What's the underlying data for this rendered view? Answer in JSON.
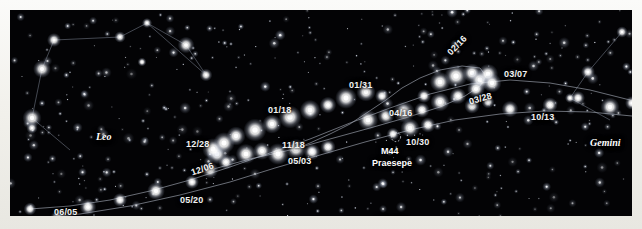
{
  "figure": {
    "kind": "star-chart",
    "sky_color": "#030305",
    "paper_color": "#f4f3ef",
    "label_color": "#f2f2f2",
    "track_color": "#9aa0ac"
  },
  "constellations": [
    {
      "name": "Leo",
      "x": 86,
      "y": 122,
      "rot": 0
    },
    {
      "name": "Cancer",
      "x": 366,
      "y": 207,
      "rot": 0
    },
    {
      "name": "Gemini",
      "x": 580,
      "y": 128,
      "rot": 0
    }
  ],
  "deep_sky_objects": [
    {
      "id": "M44",
      "name": "Praesepe",
      "x": 386,
      "y": 127,
      "label_id_x": 371,
      "label_id_y": 137,
      "label_name_x": 362,
      "label_name_y": 149
    }
  ],
  "date_labels": [
    {
      "text": "06/05",
      "x": 44,
      "y": 198,
      "rot": 0
    },
    {
      "text": "05/20",
      "x": 170,
      "y": 186,
      "rot": 0
    },
    {
      "text": "12/06",
      "x": 180,
      "y": 159,
      "rot": -19
    },
    {
      "text": "12/28",
      "x": 176,
      "y": 130,
      "rot": 0
    },
    {
      "text": "11/18",
      "x": 272,
      "y": 131,
      "rot": 0
    },
    {
      "text": "05/03",
      "x": 278,
      "y": 147,
      "rot": 0
    },
    {
      "text": "01/18",
      "x": 258,
      "y": 96,
      "rot": 0
    },
    {
      "text": "01/31",
      "x": 339,
      "y": 71,
      "rot": 0
    },
    {
      "text": "04/16",
      "x": 379,
      "y": 99,
      "rot": 0
    },
    {
      "text": "10/30",
      "x": 396,
      "y": 128,
      "rot": 0
    },
    {
      "text": "02/16",
      "x": 436,
      "y": 41,
      "rot": -46
    },
    {
      "text": "03/28",
      "x": 458,
      "y": 88,
      "rot": -16
    },
    {
      "text": "03/07",
      "x": 494,
      "y": 60,
      "rot": 0
    },
    {
      "text": "10/13",
      "x": 521,
      "y": 103,
      "rot": 0
    }
  ],
  "track_polylines": [
    {
      "name": "upper-track",
      "points": "20,199 60,196 100,190 140,181 180,170 220,157 260,143 300,129 340,113 380,98 420,84 460,74 500,70 540,73 580,80 620,90"
    },
    {
      "name": "middle-track",
      "points": "18,209 70,204 120,196 170,185 220,172 265,158 310,145 355,132 400,120 445,110 490,104 535,101 580,102 622,106"
    },
    {
      "name": "loop-track",
      "points": "200,160 240,149 280,140 320,129 360,118 395,108 430,97 455,86 470,76 476,66 470,58 452,56 430,60 410,68 392,78 376,90 358,102 340,114 320,124 300,133 280,141"
    }
  ],
  "constellation_lines": [
    {
      "name": "leo-figure",
      "points": "32,59 44,30 110,27 137,13 176,35 196,65 137,13"
    },
    {
      "name": "leo-lower",
      "points": "32,59 22,108 60,140"
    },
    {
      "name": "gemini-figure",
      "points": "612,22 578,62 560,88 600,110"
    }
  ],
  "track_stars": [
    {
      "x": 20,
      "y": 199,
      "r": 2.0
    },
    {
      "x": 48,
      "y": 208,
      "r": 2.4
    },
    {
      "x": 78,
      "y": 197,
      "r": 2.6
    },
    {
      "x": 110,
      "y": 190,
      "r": 2.2
    },
    {
      "x": 146,
      "y": 181,
      "r": 2.8
    },
    {
      "x": 182,
      "y": 172,
      "r": 2.2
    },
    {
      "x": 200,
      "y": 160,
      "r": 2.6
    },
    {
      "x": 216,
      "y": 152,
      "r": 2.4
    },
    {
      "x": 207,
      "y": 144,
      "r": 3.2
    },
    {
      "x": 203,
      "y": 139,
      "r": 3.4
    },
    {
      "x": 214,
      "y": 133,
      "r": 3.4
    },
    {
      "x": 226,
      "y": 126,
      "r": 3.0
    },
    {
      "x": 236,
      "y": 144,
      "r": 3.2
    },
    {
      "x": 252,
      "y": 141,
      "r": 2.8
    },
    {
      "x": 268,
      "y": 144,
      "r": 3.4
    },
    {
      "x": 286,
      "y": 139,
      "r": 3.2
    },
    {
      "x": 302,
      "y": 142,
      "r": 2.6
    },
    {
      "x": 318,
      "y": 137,
      "r": 2.4
    },
    {
      "x": 245,
      "y": 120,
      "r": 3.6
    },
    {
      "x": 262,
      "y": 114,
      "r": 3.0
    },
    {
      "x": 280,
      "y": 107,
      "r": 3.6
    },
    {
      "x": 300,
      "y": 100,
      "r": 3.2
    },
    {
      "x": 318,
      "y": 95,
      "r": 2.6
    },
    {
      "x": 336,
      "y": 88,
      "r": 3.4
    },
    {
      "x": 356,
      "y": 82,
      "r": 3.0
    },
    {
      "x": 372,
      "y": 86,
      "r": 2.2
    },
    {
      "x": 358,
      "y": 110,
      "r": 3.2
    },
    {
      "x": 376,
      "y": 106,
      "r": 2.6
    },
    {
      "x": 394,
      "y": 102,
      "r": 3.4
    },
    {
      "x": 412,
      "y": 100,
      "r": 2.4
    },
    {
      "x": 400,
      "y": 118,
      "r": 3.0
    },
    {
      "x": 418,
      "y": 115,
      "r": 2.4
    },
    {
      "x": 383,
      "y": 124,
      "r": 2.0
    },
    {
      "x": 430,
      "y": 72,
      "r": 3.2
    },
    {
      "x": 446,
      "y": 66,
      "r": 3.6
    },
    {
      "x": 462,
      "y": 63,
      "r": 3.0
    },
    {
      "x": 470,
      "y": 70,
      "r": 3.4
    },
    {
      "x": 478,
      "y": 64,
      "r": 3.2
    },
    {
      "x": 482,
      "y": 73,
      "r": 3.0
    },
    {
      "x": 466,
      "y": 79,
      "r": 2.8
    },
    {
      "x": 448,
      "y": 86,
      "r": 2.6
    },
    {
      "x": 430,
      "y": 92,
      "r": 3.0
    },
    {
      "x": 414,
      "y": 86,
      "r": 2.2
    },
    {
      "x": 462,
      "y": 96,
      "r": 2.4
    },
    {
      "x": 478,
      "y": 92,
      "r": 2.0
    },
    {
      "x": 500,
      "y": 99,
      "r": 2.6
    },
    {
      "x": 540,
      "y": 95,
      "r": 2.4
    },
    {
      "x": 568,
      "y": 88,
      "r": 2.2
    },
    {
      "x": 600,
      "y": 97,
      "r": 3.0
    },
    {
      "x": 622,
      "y": 93,
      "r": 2.2
    }
  ],
  "bright_field_stars": [
    {
      "x": 32,
      "y": 59,
      "r": 2.8
    },
    {
      "x": 44,
      "y": 30,
      "r": 2.2
    },
    {
      "x": 110,
      "y": 27,
      "r": 1.8
    },
    {
      "x": 137,
      "y": 13,
      "r": 1.6
    },
    {
      "x": 176,
      "y": 35,
      "r": 2.6
    },
    {
      "x": 196,
      "y": 65,
      "r": 2.0
    },
    {
      "x": 22,
      "y": 108,
      "r": 3.0
    },
    {
      "x": 22,
      "y": 118,
      "r": 1.8
    },
    {
      "x": 612,
      "y": 22,
      "r": 1.8
    },
    {
      "x": 578,
      "y": 62,
      "r": 2.2
    },
    {
      "x": 560,
      "y": 88,
      "r": 1.6
    },
    {
      "x": 132,
      "y": 52,
      "r": 1.4
    }
  ]
}
